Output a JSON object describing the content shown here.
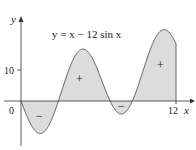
{
  "chart_data": {
    "type": "area",
    "title": "y = x − 12 sin x",
    "xlabel": "x",
    "ylabel": "y",
    "xlim": [
      0,
      12
    ],
    "ylim": [
      -12,
      30
    ],
    "x_ticks": [
      "0",
      "12"
    ],
    "y_ticks": [
      "10"
    ],
    "function": "x - 12*sin(x)",
    "annotations": [
      {
        "text": "−",
        "region": "negative",
        "x": 1.6
      },
      {
        "text": "+",
        "region": "positive",
        "x": 5.0
      },
      {
        "text": "−",
        "region": "negative",
        "x": 7.8
      },
      {
        "text": "+",
        "region": "positive",
        "x": 11.1
      }
    ],
    "fill_color": "#dcdcdc",
    "line_color": "#555555"
  },
  "labels": {
    "equation": "y = x − 12 sin x",
    "y_axis": "y",
    "x_axis": "x",
    "origin": "0",
    "tick_10": "10",
    "tick_12": "12",
    "plus": "+",
    "minus": "−"
  }
}
